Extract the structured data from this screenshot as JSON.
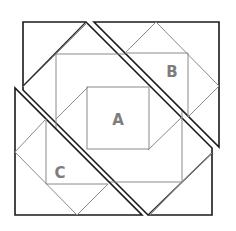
{
  "diagram": {
    "title": "",
    "labels": {
      "a": "A",
      "b": "B",
      "c": "C"
    },
    "pieces": [
      {
        "id": "piece-a",
        "label": "A",
        "description": "central piece containing square A"
      },
      {
        "id": "piece-b",
        "label": "B",
        "description": "upper-right triangular piece"
      },
      {
        "id": "piece-c",
        "label": "C",
        "description": "lower-left triangular piece"
      }
    ],
    "colors": {
      "outline": "#1a1a1a",
      "inner_line": "#8a8a8a",
      "label": "#7d7d7d",
      "background": "#ffffff"
    }
  }
}
